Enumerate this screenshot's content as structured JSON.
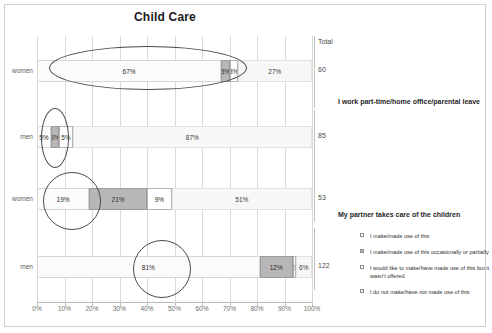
{
  "title": "Child Care",
  "total_header": "Total",
  "sections": [
    {
      "heading": "I work part-time/home office/parental leave"
    },
    {
      "heading": "My partner takes care of the children"
    }
  ],
  "legend": [
    {
      "label": "I make/made use of this"
    },
    {
      "label": "I make/made use of this occasionally or partially"
    },
    {
      "label": "I would like to make/have made use of this but it wasn't offered"
    },
    {
      "label": "I do not make/have not made use of this"
    }
  ],
  "chart_data": {
    "type": "bar",
    "orientation": "horizontal",
    "stacked": true,
    "stacked_percent": true,
    "title": "Child Care",
    "xlabel": "",
    "ylabel": "",
    "xlim": [
      0,
      100
    ],
    "xticks": [
      0,
      10,
      20,
      30,
      40,
      50,
      60,
      70,
      80,
      90,
      100
    ],
    "xtick_labels": [
      "0%",
      "10%",
      "20%",
      "30%",
      "40%",
      "50%",
      "60%",
      "70%",
      "80%",
      "90%",
      "100%"
    ],
    "grid": true,
    "legend_position": "right",
    "series": [
      {
        "name": "I make/made use of this",
        "color": "#fbfbfb"
      },
      {
        "name": "I make/made use of this occasionally or partially",
        "color": "#b7b7b7"
      },
      {
        "name": "I would like to make/have made use of this but it wasn't offered",
        "color": "#ffffff"
      },
      {
        "name": "I do not make/have not made use of this",
        "color": "#f7f7f7"
      }
    ],
    "groups": [
      {
        "group": "I work part-time/home office/parental leave",
        "rows": [
          {
            "category": "women",
            "values": [
              67,
              3,
              3,
              27
            ],
            "labels": [
              "67%",
              "3%",
              "3%",
              "27%"
            ],
            "total": "60"
          },
          {
            "category": "men",
            "values": [
              5,
              3,
              5,
              87
            ],
            "labels": [
              "5%",
              "3%",
              "5%",
              "87%"
            ],
            "total": "85"
          }
        ]
      },
      {
        "group": "My partner takes care of the children",
        "rows": [
          {
            "category": "women",
            "values": [
              19,
              21,
              9,
              51
            ],
            "labels": [
              "19%",
              "21%",
              "9%",
              "51%"
            ],
            "total": "53"
          },
          {
            "category": "men",
            "values": [
              81,
              12,
              1,
              6
            ],
            "labels": [
              "81%",
              "12%",
              "1%",
              "6%"
            ],
            "total": "122"
          }
        ]
      }
    ],
    "annotations": [
      {
        "shape": "ellipse",
        "target": "women-row-1-segment-1"
      },
      {
        "shape": "ellipse",
        "target": "men-row-1-segment-1"
      },
      {
        "shape": "ellipse",
        "target": "women-row-2-segment-1"
      },
      {
        "shape": "ellipse",
        "target": "men-row-2-segment-1"
      }
    ]
  }
}
